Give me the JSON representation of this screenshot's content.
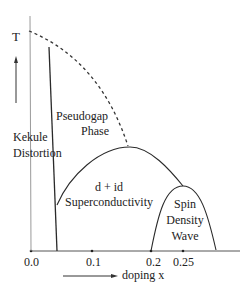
{
  "diagram": {
    "type": "phase-diagram",
    "y_axis_label": "T",
    "x_axis_label": "doping x",
    "x_ticks": [
      "0.0",
      "0.1",
      "0.2",
      "0.25"
    ],
    "regions": {
      "kekule": {
        "line1": "Kekule",
        "line2": "Distortion"
      },
      "pseudogap": {
        "line1": "Pseudogap",
        "line2": "Phase"
      },
      "superconductivity": {
        "line1": "d + id",
        "line2": "Superconductivity"
      },
      "sdw": {
        "line1": "Spin",
        "line2": "Density",
        "line3": "Wave"
      }
    },
    "colors": {
      "line": "#2a2a2a",
      "kekule_boundary": "#9a9a9a",
      "text": "#222222"
    }
  }
}
